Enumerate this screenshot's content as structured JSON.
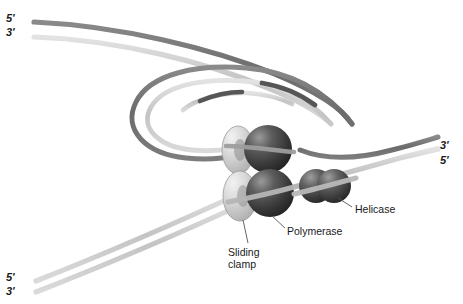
{
  "figure": {
    "background_color": "#ffffff"
  },
  "colors": {
    "parental_dark_strand": "#6e6e6e",
    "daughter_light_strand": "#c9c9c9",
    "okazaki_segment": "#555555",
    "protein_dark": "#3a3a3a",
    "protein_highlight": "#8e8e8e",
    "clamp_light": "#d0d0d0",
    "label_text": "#1a1a1a",
    "leader_line": "#555555"
  },
  "end_labels": {
    "top_left_upper": "5'",
    "top_left_lower": "3'",
    "right_upper": "3'",
    "right_lower": "5'",
    "bottom_left_upper": "5'",
    "bottom_left_lower": "3'"
  },
  "parts": {
    "helicase": "Helicase",
    "polymerase": "Polymerase",
    "sliding_clamp_line1": "Sliding",
    "sliding_clamp_line2": "clamp",
    "sliding_clamp_full": "Sliding clamp"
  },
  "structures": {
    "strand_count": 4,
    "okazaki_fragment_count": 2,
    "protein_spheres": 3,
    "sliding_clamps": 2,
    "loop_description": "lagging strand trombone loop"
  }
}
